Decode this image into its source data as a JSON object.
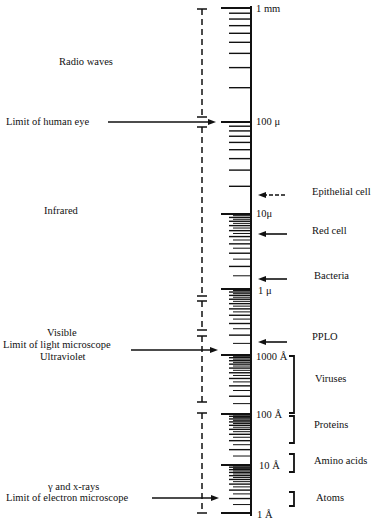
{
  "diagram": {
    "title": "",
    "scale": {
      "axis_x": 251,
      "major_labels": [
        {
          "id": "1mm",
          "text": "1 mm",
          "y": 8
        },
        {
          "id": "100mu",
          "text": "100 μ",
          "y": 122
        },
        {
          "id": "10mu",
          "text": "10μ",
          "y": 214
        },
        {
          "id": "1mu",
          "text": "1 μ",
          "y": 289
        },
        {
          "id": "1000A",
          "text": "1000 Å",
          "y": 355
        },
        {
          "id": "100A",
          "text": "100 Å",
          "y": 414
        },
        {
          "id": "10A",
          "text": "10 Å",
          "y": 465
        },
        {
          "id": "1A",
          "text": "1 Å",
          "y": 513
        }
      ]
    },
    "radiation_bands": [
      {
        "id": "radio",
        "text": "Radio waves",
        "x": 59,
        "y": 56
      },
      {
        "id": "infrared",
        "text": "Infrared",
        "x": 44,
        "y": 205
      },
      {
        "id": "visible",
        "text": "Visible",
        "x": 47,
        "y": 327
      },
      {
        "id": "ultraviolet",
        "text": "Ultraviolet",
        "x": 40,
        "y": 351
      },
      {
        "id": "gamma-xray",
        "text": "γ and x-rays",
        "x": 48,
        "y": 481
      }
    ],
    "limits": [
      {
        "id": "human-eye",
        "text": "Limit of human eye",
        "x": 6,
        "y": 116,
        "arrow_y": 122
      },
      {
        "id": "light-microscope",
        "text": "Limit of light microscope",
        "x": 3,
        "y": 339,
        "arrow_y": 350
      },
      {
        "id": "electron-microscope",
        "text": "Limit of electron microscope",
        "x": 6,
        "y": 492,
        "arrow_y": 498
      }
    ],
    "objects": [
      {
        "id": "epithelial-cell",
        "text": "Epithelial cell",
        "x": 312,
        "y": 186,
        "arrow_y": 195,
        "dashed": true
      },
      {
        "id": "red-cell",
        "text": "Red cell",
        "x": 312,
        "y": 225,
        "arrow_y": 234,
        "dashed": false
      },
      {
        "id": "bacteria",
        "text": "Bacteria",
        "x": 314,
        "y": 270,
        "arrow_y": 279,
        "dashed": false
      },
      {
        "id": "pplo",
        "text": "PPLO",
        "x": 312,
        "y": 331,
        "arrow_y": 342,
        "dashed": false
      },
      {
        "id": "viruses",
        "text": "Viruses",
        "x": 315,
        "y": 373
      },
      {
        "id": "proteins",
        "text": "Proteins",
        "x": 314,
        "y": 419
      },
      {
        "id": "amino-acids",
        "text": "Amino acids",
        "x": 314,
        "y": 455
      },
      {
        "id": "atoms",
        "text": "Atoms",
        "x": 316,
        "y": 492
      }
    ],
    "brackets": [
      {
        "id": "viruses-bracket",
        "x": 294,
        "top": 356,
        "bottom": 413
      },
      {
        "id": "proteins-bracket",
        "x": 294,
        "top": 416,
        "bottom": 443
      },
      {
        "id": "amino-acids-bracket",
        "x": 294,
        "top": 454,
        "bottom": 472
      },
      {
        "id": "atoms-bracket",
        "x": 294,
        "top": 492,
        "bottom": 506
      }
    ],
    "colors": {
      "ink": "#111111",
      "paper": "#ffffff"
    }
  }
}
